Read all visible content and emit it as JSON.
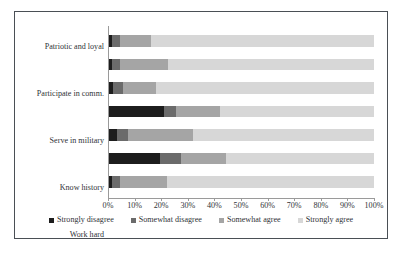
{
  "chart_data": {
    "type": "bar",
    "orientation": "horizontal",
    "stacked": true,
    "stack_total": 100,
    "title": "",
    "xlabel": "",
    "ylabel": "",
    "xlim": [
      0,
      100
    ],
    "grid": false,
    "legend_position": "bottom",
    "categories": [
      "Patriotic and loyal",
      "Participate in comm.",
      "Serve in military",
      "Know history",
      "Work hard",
      "Vote in elections",
      "Obey the law"
    ],
    "tick_labels": [
      "0%",
      "10%",
      "20%",
      "30%",
      "40%",
      "50%",
      "60%",
      "70%",
      "80%",
      "90%",
      "100%"
    ],
    "tick_values": [
      0,
      10,
      20,
      30,
      40,
      50,
      60,
      70,
      80,
      90,
      100
    ],
    "series": [
      {
        "name": "Strongly disagree",
        "color": "#1d1d1d",
        "values": [
          1.5,
          1.5,
          2.0,
          21.0,
          3.5,
          19.5,
          1.5
        ]
      },
      {
        "name": "Somewhat disagree",
        "color": "#6b6b6b",
        "values": [
          3.0,
          3.0,
          3.5,
          4.5,
          4.0,
          8.0,
          3.0
        ]
      },
      {
        "name": "Somewhat agree",
        "color": "#a5a5a5",
        "values": [
          11.5,
          18.0,
          12.5,
          16.5,
          24.5,
          17.0,
          17.5
        ]
      },
      {
        "name": "Strongly agree",
        "color": "#d7d7d7",
        "values": [
          84.0,
          77.5,
          82.0,
          58.0,
          68.0,
          55.5,
          78.0
        ]
      }
    ]
  }
}
